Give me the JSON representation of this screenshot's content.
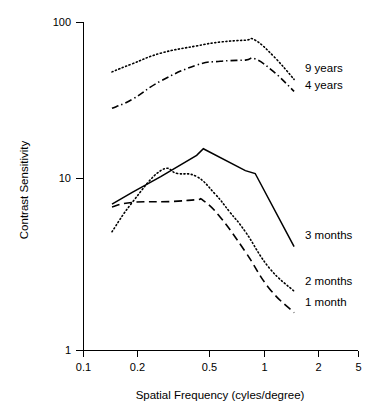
{
  "chart_data": {
    "type": "line",
    "title": "",
    "xlabel": "Spatial Frequency (cyles/degree)",
    "ylabel": "Contrast Sensitivity",
    "xscale": "log",
    "yscale": "log",
    "xlim": [
      0.1,
      5
    ],
    "ylim": [
      1,
      100
    ],
    "xticks": [
      0.1,
      0.2,
      0.5,
      1,
      2,
      5
    ],
    "xtick_labels": [
      "0.1",
      "0.2",
      "0.5",
      "1",
      "2",
      "5"
    ],
    "yticks": [
      1,
      10,
      100
    ],
    "ytick_labels": [
      "1",
      "10",
      "100"
    ],
    "grid": false,
    "legend_position": "inline-right-of-curve-ends",
    "series": [
      {
        "name": "9 years",
        "style": "dotted",
        "label_x": 305,
        "label_y": 72,
        "x": [
          0.15,
          0.2,
          0.3,
          0.5,
          0.7,
          1.0,
          1.15,
          1.5,
          2.0
        ],
        "y": [
          50,
          56,
          65,
          72,
          76,
          78,
          78,
          62,
          45
        ]
      },
      {
        "name": "4 years",
        "style": "dash-dot",
        "label_x": 305,
        "label_y": 89,
        "x": [
          0.15,
          0.2,
          0.3,
          0.5,
          0.7,
          1.0,
          1.15,
          1.5,
          2.0
        ],
        "y": [
          30,
          34,
          44,
          55,
          58,
          59,
          60,
          50,
          38
        ]
      },
      {
        "name": "3 months",
        "style": "solid",
        "label_x": 305,
        "label_y": 239,
        "x": [
          0.15,
          0.2,
          0.3,
          0.5,
          0.55,
          1.0,
          1.15,
          2.0
        ],
        "y": [
          7.8,
          9.2,
          11.5,
          15.5,
          17.0,
          12.5,
          12.0,
          4.3
        ]
      },
      {
        "name": "2 months",
        "style": "dotted",
        "label_x": 305,
        "label_y": 285,
        "x": [
          0.15,
          0.2,
          0.3,
          0.38,
          0.5,
          0.65,
          0.8,
          1.0,
          1.4,
          2.0
        ],
        "y": [
          5.3,
          8.0,
          12.5,
          12.0,
          11.5,
          9.0,
          7.0,
          5.3,
          3.2,
          2.3
        ]
      },
      {
        "name": "1 month",
        "style": "dashed",
        "label_x": 305,
        "label_y": 306,
        "x": [
          0.15,
          0.2,
          0.35,
          0.5,
          0.55,
          0.7,
          1.0,
          1.4,
          2.0
        ],
        "y": [
          7.5,
          8.0,
          8.1,
          8.3,
          8.2,
          6.5,
          4.0,
          2.4,
          1.7
        ]
      }
    ]
  },
  "labels": {
    "ylabel": "Contrast Sensitivity",
    "xlabel": "Spatial Frequency (cyles/degree)",
    "y_100": "100",
    "y_10": "10",
    "y_1": "1",
    "x_01": "0.1",
    "x_02": "0.2",
    "x_05": "0.5",
    "x_1": "1",
    "x_2": "2",
    "x_5": "5",
    "s_9years": "9 years",
    "s_4years": "4 years",
    "s_3months": "3 months",
    "s_2months": "2 months",
    "s_1month": "1 month"
  },
  "colors": {
    "axis": "#000000",
    "curve": "#000000",
    "background": "#ffffff"
  }
}
